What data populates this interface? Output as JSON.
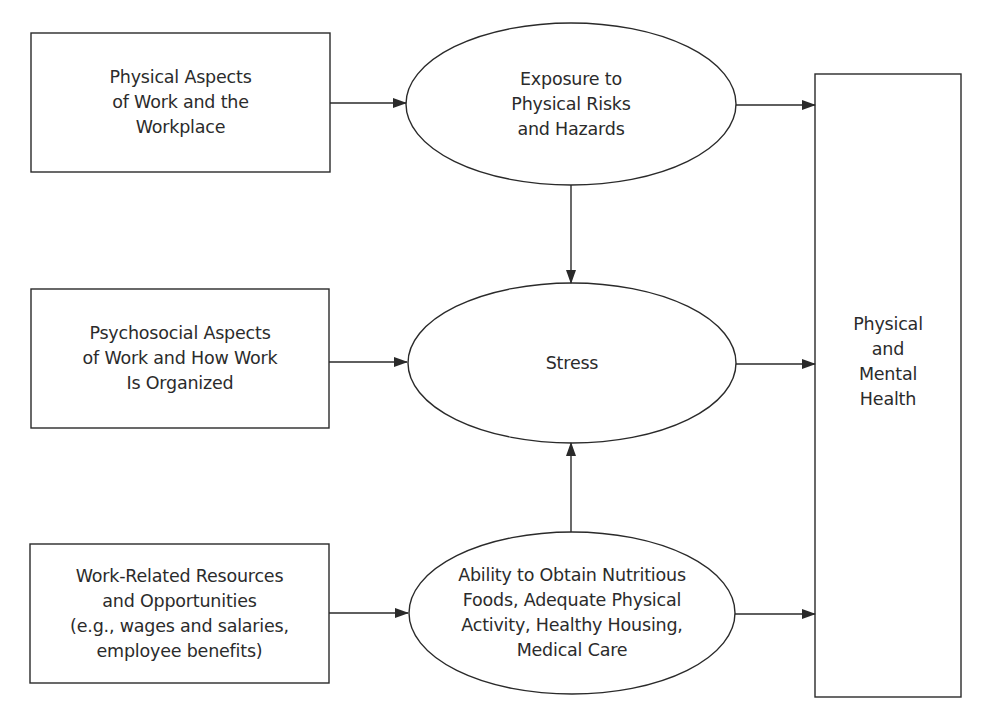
{
  "diagram": {
    "type": "flow",
    "colors": {
      "stroke": "#2a2a2a",
      "background": "#ffffff",
      "text": "#2b2b2b"
    },
    "nodes": {
      "physical_aspects": {
        "shape": "rectangle",
        "label": "Physical Aspects\nof Work and the\nWorkplace"
      },
      "psychosocial_aspects": {
        "shape": "rectangle",
        "label": "Psychosocial Aspects\nof Work and How Work\nIs Organized"
      },
      "work_resources": {
        "shape": "rectangle",
        "label": "Work-Related Resources\nand Opportunities\n(e.g., wages and salaries,\nemployee benefits)"
      },
      "exposure": {
        "shape": "ellipse",
        "label": "Exposure to\nPhysical Risks\nand Hazards"
      },
      "stress": {
        "shape": "ellipse",
        "label": "Stress"
      },
      "ability": {
        "shape": "ellipse",
        "label": "Ability to Obtain Nutritious\nFoods, Adequate Physical\nActivity, Healthy Housing,\nMedical Care"
      },
      "health": {
        "shape": "rectangle",
        "label": "Physical\nand\nMental\nHealth"
      }
    },
    "edges": [
      {
        "from": "physical_aspects",
        "to": "exposure"
      },
      {
        "from": "psychosocial_aspects",
        "to": "stress"
      },
      {
        "from": "work_resources",
        "to": "ability"
      },
      {
        "from": "exposure",
        "to": "stress"
      },
      {
        "from": "ability",
        "to": "stress"
      },
      {
        "from": "exposure",
        "to": "health"
      },
      {
        "from": "stress",
        "to": "health"
      },
      {
        "from": "ability",
        "to": "health"
      }
    ]
  }
}
